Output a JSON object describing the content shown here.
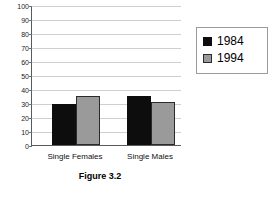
{
  "chart_data": {
    "type": "bar",
    "title": "",
    "caption": "Figure 3.2",
    "xlabel": "",
    "ylabel": "",
    "categories": [
      "Single Females",
      "Single Males"
    ],
    "series": [
      {
        "name": "1984",
        "values": [
          29,
          35
        ],
        "color": "#0d0d0d"
      },
      {
        "name": "1994",
        "values": [
          35,
          31
        ],
        "color": "#9a9a9a"
      }
    ],
    "ylim": [
      0,
      100
    ],
    "ytick_step": 10,
    "yticks": [
      100,
      90,
      80,
      70,
      60,
      50,
      40,
      30,
      20,
      10,
      0
    ],
    "grid": true,
    "legend_position": "right"
  },
  "legend": {
    "entries": [
      {
        "label": "1984",
        "marker": "filled-square-black"
      },
      {
        "label": "1994",
        "marker": "filled-square-gray"
      }
    ]
  },
  "colors": {
    "series_1984": "#0d0d0d",
    "series_1994": "#9a9a9a",
    "gridline": "#cfcfcf",
    "axis": "#5a5a5a",
    "background": "#ffffff"
  }
}
